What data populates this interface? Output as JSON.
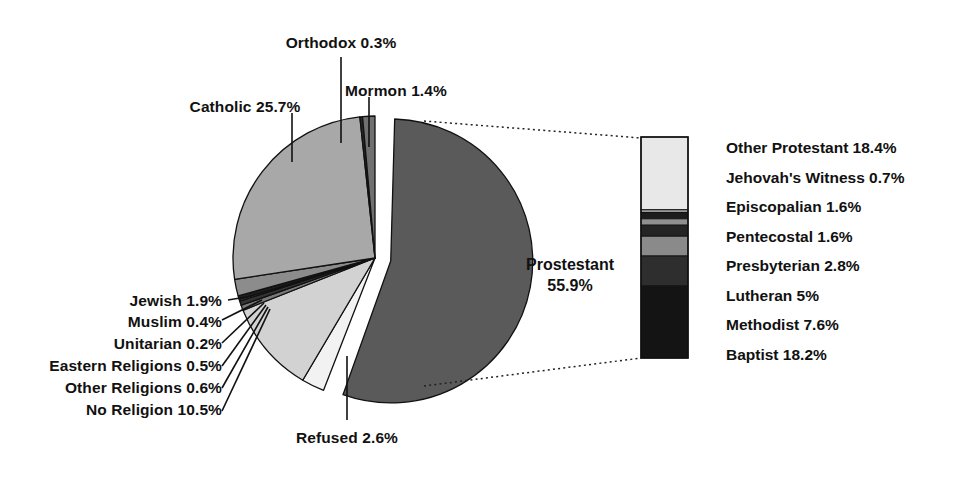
{
  "chart_data": {
    "type": "pie",
    "title": "",
    "subtitle": "",
    "xlabel": "",
    "ylabel": "",
    "legend_position": "labels-with-leader-lines",
    "grid": false,
    "units": "percent",
    "categories": [
      "Prostestant",
      "Catholic",
      "No Religion",
      "Refused",
      "Jewish",
      "Mormon",
      "Other Religions",
      "Eastern Religions",
      "Muslim",
      "Orthodox",
      "Unitarian"
    ],
    "values": [
      55.9,
      25.7,
      10.5,
      2.6,
      1.9,
      1.4,
      0.6,
      0.5,
      0.4,
      0.3,
      0.2
    ],
    "exploded_slice": "Prostestant",
    "breakout": {
      "type": "bar",
      "parent": "Prostestant",
      "orientation": "vertical-stacked",
      "categories": [
        "Other Protestant",
        "Jehovah's Witness",
        "Episcopalian",
        "Pentecostal",
        "Presbyterian",
        "Lutheran",
        "Methodist",
        "Baptist"
      ],
      "values": [
        18.4,
        0.7,
        1.6,
        1.6,
        2.8,
        5,
        7.6,
        18.2
      ],
      "total": 55.9
    }
  },
  "pie": {
    "slices": [
      {
        "name": "Prostestant",
        "label": "Prostestant",
        "value_label": "55.9%",
        "percent": 55.9,
        "fill": "#5a5a5a",
        "exploded": true
      },
      {
        "name": "Catholic",
        "label": "Catholic 25.7%",
        "percent": 25.7,
        "fill": "#a8a8a8",
        "exploded": false
      },
      {
        "name": "Orthodox",
        "label": "Orthodox 0.3%",
        "percent": 0.3,
        "fill": "#2a2a2a",
        "exploded": false
      },
      {
        "name": "Mormon",
        "label": "Mormon 1.4%",
        "percent": 1.4,
        "fill": "#707070",
        "exploded": false
      },
      {
        "name": "Jewish",
        "label": "Jewish 1.9%",
        "percent": 1.9,
        "fill": "#8c8c8c",
        "exploded": false
      },
      {
        "name": "Muslim",
        "label": "Muslim 0.4%",
        "percent": 0.4,
        "fill": "#1e1e1e",
        "exploded": false
      },
      {
        "name": "Unitarian",
        "label": "Unitarian 0.2%",
        "percent": 0.2,
        "fill": "#5e5e5e",
        "exploded": false
      },
      {
        "name": "Eastern Religions",
        "label": "Eastern Religions 0.5%",
        "percent": 0.5,
        "fill": "#343434",
        "exploded": false
      },
      {
        "name": "Other Religions",
        "label": "Other Religions 0.6%",
        "percent": 0.6,
        "fill": "#787878",
        "exploded": false
      },
      {
        "name": "No Religion",
        "label": "No Religion 10.5%",
        "percent": 10.5,
        "fill": "#d2d2d2",
        "exploded": false
      },
      {
        "name": "Refused",
        "label": "Refused 2.6%",
        "percent": 2.6,
        "fill": "#f2f2f2",
        "exploded": false
      }
    ]
  },
  "breakout_bar": {
    "segments": [
      {
        "name": "Other Protestant",
        "label": "Other Protestant 18.4%",
        "percent": 18.4,
        "fill": "#e8e8e8"
      },
      {
        "name": "Jehovah's Witness",
        "label": "Jehovah's Witness 0.7%",
        "percent": 0.7,
        "fill": "#9a9a9a"
      },
      {
        "name": "Episcopalian",
        "label": "Episcopalian 1.6%",
        "percent": 1.6,
        "fill": "#1c1c1c"
      },
      {
        "name": "Pentecostal",
        "label": "Pentecostal 1.6%",
        "percent": 1.6,
        "fill": "#8f8f8f"
      },
      {
        "name": "Presbyterian",
        "label": "Presbyterian 2.8%",
        "percent": 2.8,
        "fill": "#242424"
      },
      {
        "name": "Lutheran",
        "label": "Lutheran 5%",
        "percent": 5,
        "fill": "#8a8a8a"
      },
      {
        "name": "Methodist",
        "label": "Methodist 7.6%",
        "percent": 7.6,
        "fill": "#2e2e2e"
      },
      {
        "name": "Baptist",
        "label": "Baptist 18.2%",
        "percent": 18.2,
        "fill": "#141414"
      }
    ]
  },
  "colors": {
    "background": "#ffffff",
    "text": "#111111",
    "outline": "#111111"
  }
}
